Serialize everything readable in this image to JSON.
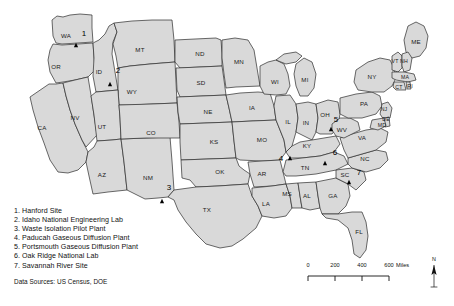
{
  "figure": {
    "type": "thematic-map",
    "region": "Contiguous United States",
    "background_color": "#ffffff",
    "state_fill_color": "#d9d9d9",
    "state_border_color": "#2b2b2b",
    "marker_color": "#000000",
    "marker_shape": "triangle"
  },
  "sites": [
    {
      "number": "1",
      "name": "Hanford Site",
      "state": "WA",
      "x": 76,
      "y": 45,
      "label_x": 84,
      "label_y": 36
    },
    {
      "number": "2",
      "name": "Idaho National Engineering Lab",
      "state": "ID",
      "x": 110,
      "y": 84,
      "label_x": 118,
      "label_y": 73
    },
    {
      "number": "3",
      "name": "Waste Isolation Pilot Plant",
      "state": "NM",
      "x": 162,
      "y": 201,
      "label_x": 169,
      "label_y": 190
    },
    {
      "number": "4",
      "name": "Paducah Gaseous Diffusion Plant",
      "state": "KY",
      "x": 290,
      "y": 158,
      "label_x": 281,
      "label_y": 161
    },
    {
      "number": "5",
      "name": "Portsmouth Gaseous Diffusion Plant",
      "state": "OH",
      "x": 331,
      "y": 129,
      "label_x": 336,
      "label_y": 122
    },
    {
      "number": "6",
      "name": "Oak Ridge National Lab",
      "state": "TN",
      "x": 325,
      "y": 163,
      "label_x": 335,
      "label_y": 155
    },
    {
      "number": "7",
      "name": "Savannah River Site",
      "state": "SC",
      "x": 349,
      "y": 182,
      "label_x": 359,
      "label_y": 175
    }
  ],
  "legend": {
    "items": [
      "1. Hanford Site",
      "2. Idaho National Engineering Lab",
      "3. Waste Isolation Pilot Plant",
      "4. Paducah Gaseous Diffusion Plant",
      "5. Portsmouth Gaseous Diffusion Plant",
      "6. Oak Ridge National Lab",
      "7. Savannah River Site"
    ]
  },
  "data_sources": "Data Sources: US Census, DOE",
  "scale_bar": {
    "ticks": [
      "0",
      "200",
      "400",
      "600"
    ],
    "unit": "Miles",
    "max_value": 600
  },
  "north_arrow": {
    "label": "N"
  },
  "state_labels": [
    {
      "abbr": "WA",
      "x": 66,
      "y": 36
    },
    {
      "abbr": "OR",
      "x": 56,
      "y": 67
    },
    {
      "abbr": "CA",
      "x": 42,
      "y": 128
    },
    {
      "abbr": "NV",
      "x": 75,
      "y": 118
    },
    {
      "abbr": "ID",
      "x": 99,
      "y": 72
    },
    {
      "abbr": "MT",
      "x": 140,
      "y": 50
    },
    {
      "abbr": "WY",
      "x": 132,
      "y": 92
    },
    {
      "abbr": "UT",
      "x": 102,
      "y": 127
    },
    {
      "abbr": "AZ",
      "x": 102,
      "y": 175
    },
    {
      "abbr": "NM",
      "x": 148,
      "y": 178
    },
    {
      "abbr": "CO",
      "x": 151,
      "y": 133
    },
    {
      "abbr": "ND",
      "x": 200,
      "y": 54
    },
    {
      "abbr": "SD",
      "x": 201,
      "y": 83
    },
    {
      "abbr": "NE",
      "x": 208,
      "y": 112
    },
    {
      "abbr": "KS",
      "x": 214,
      "y": 142
    },
    {
      "abbr": "OK",
      "x": 220,
      "y": 172
    },
    {
      "abbr": "TX",
      "x": 207,
      "y": 210
    },
    {
      "abbr": "MN",
      "x": 239,
      "y": 62
    },
    {
      "abbr": "IA",
      "x": 252,
      "y": 108
    },
    {
      "abbr": "MO",
      "x": 262,
      "y": 140
    },
    {
      "abbr": "AR",
      "x": 262,
      "y": 174
    },
    {
      "abbr": "LA",
      "x": 266,
      "y": 204
    },
    {
      "abbr": "WI",
      "x": 275,
      "y": 82
    },
    {
      "abbr": "IL",
      "x": 288,
      "y": 122
    },
    {
      "abbr": "MS",
      "x": 287,
      "y": 194
    },
    {
      "abbr": "AL",
      "x": 307,
      "y": 196
    },
    {
      "abbr": "GA",
      "x": 333,
      "y": 196
    },
    {
      "abbr": "FL",
      "x": 359,
      "y": 232
    },
    {
      "abbr": "MI",
      "x": 305,
      "y": 80
    },
    {
      "abbr": "IN",
      "x": 306,
      "y": 123
    },
    {
      "abbr": "OH",
      "x": 325,
      "y": 115
    },
    {
      "abbr": "KY",
      "x": 307,
      "y": 146
    },
    {
      "abbr": "TN",
      "x": 305,
      "y": 168
    },
    {
      "abbr": "SC",
      "x": 345,
      "y": 175
    },
    {
      "abbr": "NC",
      "x": 365,
      "y": 159
    },
    {
      "abbr": "VA",
      "x": 362,
      "y": 138
    },
    {
      "abbr": "WV",
      "x": 342,
      "y": 130
    },
    {
      "abbr": "PA",
      "x": 364,
      "y": 104
    },
    {
      "abbr": "NY",
      "x": 372,
      "y": 77
    },
    {
      "abbr": "ME",
      "x": 416,
      "y": 42
    },
    {
      "abbr": "VT",
      "x": 395,
      "y": 62
    },
    {
      "abbr": "NH",
      "x": 404,
      "y": 62
    },
    {
      "abbr": "MA",
      "x": 405,
      "y": 78
    },
    {
      "abbr": "CT",
      "x": 399,
      "y": 88
    },
    {
      "abbr": "RI",
      "x": 410,
      "y": 87
    },
    {
      "abbr": "NJ",
      "x": 384,
      "y": 110
    },
    {
      "abbr": "DE",
      "x": 386,
      "y": 120
    },
    {
      "abbr": "MD",
      "x": 382,
      "y": 126
    }
  ]
}
